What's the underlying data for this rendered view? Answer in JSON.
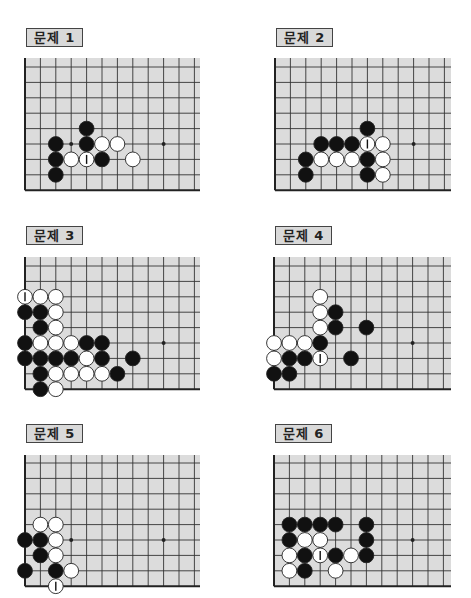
{
  "colors": {
    "board_fill": "#dcdcdc",
    "grid_line": "#333333",
    "edge_line": "#222222",
    "black_stone": "#111111",
    "white_stone": "#ffffff",
    "stone_outline": "#222222",
    "label_bg": "#d9d9d9"
  },
  "problems": [
    {
      "label": "문제 1",
      "label_pos": [
        26,
        28
      ],
      "origin": [
        25,
        67
      ],
      "top_fill": 58,
      "right_fill": 200,
      "cols": 12,
      "rows": 9,
      "hoshi": [
        [
          3,
          5
        ],
        [
          9,
          5
        ]
      ],
      "stones": [
        {
          "c": 4,
          "r": 4,
          "color": "black"
        },
        {
          "c": 2,
          "r": 5,
          "color": "black"
        },
        {
          "c": 4,
          "r": 5,
          "color": "black"
        },
        {
          "c": 5,
          "r": 5,
          "color": "white"
        },
        {
          "c": 6,
          "r": 5,
          "color": "white"
        },
        {
          "c": 2,
          "r": 6,
          "color": "black"
        },
        {
          "c": 3,
          "r": 6,
          "color": "white"
        },
        {
          "c": 4,
          "r": 6,
          "color": "white",
          "mark": true
        },
        {
          "c": 5,
          "r": 6,
          "color": "black"
        },
        {
          "c": 7,
          "r": 6,
          "color": "white"
        },
        {
          "c": 2,
          "r": 7,
          "color": "black"
        }
      ]
    },
    {
      "label": "문제 2",
      "label_pos": [
        276,
        28
      ],
      "origin": [
        275,
        67
      ],
      "top_fill": 58,
      "right_fill": 451,
      "cols": 12,
      "rows": 9,
      "hoshi": [
        [
          9,
          5
        ]
      ],
      "stones": [
        {
          "c": 6,
          "r": 4,
          "color": "black"
        },
        {
          "c": 3,
          "r": 5,
          "color": "black"
        },
        {
          "c": 4,
          "r": 5,
          "color": "black"
        },
        {
          "c": 5,
          "r": 5,
          "color": "black"
        },
        {
          "c": 6,
          "r": 5,
          "color": "white",
          "mark": true
        },
        {
          "c": 7,
          "r": 5,
          "color": "white"
        },
        {
          "c": 2,
          "r": 6,
          "color": "black"
        },
        {
          "c": 3,
          "r": 6,
          "color": "white"
        },
        {
          "c": 4,
          "r": 6,
          "color": "white"
        },
        {
          "c": 5,
          "r": 6,
          "color": "white"
        },
        {
          "c": 6,
          "r": 6,
          "color": "black"
        },
        {
          "c": 7,
          "r": 6,
          "color": "white"
        },
        {
          "c": 2,
          "r": 7,
          "color": "black"
        },
        {
          "c": 6,
          "r": 7,
          "color": "black"
        },
        {
          "c": 7,
          "r": 7,
          "color": "white"
        }
      ]
    },
    {
      "label": "문제 3",
      "label_pos": [
        26,
        226
      ],
      "origin": [
        25,
        266
      ],
      "top_fill": 257,
      "right_fill": 200,
      "cols": 12,
      "rows": 9,
      "hoshi": [
        [
          9,
          5
        ]
      ],
      "stones": [
        {
          "c": 0,
          "r": 2,
          "color": "white",
          "mark": true
        },
        {
          "c": 1,
          "r": 2,
          "color": "white"
        },
        {
          "c": 2,
          "r": 2,
          "color": "white"
        },
        {
          "c": 0,
          "r": 3,
          "color": "black"
        },
        {
          "c": 1,
          "r": 3,
          "color": "black"
        },
        {
          "c": 2,
          "r": 3,
          "color": "white"
        },
        {
          "c": 1,
          "r": 4,
          "color": "black"
        },
        {
          "c": 2,
          "r": 4,
          "color": "white"
        },
        {
          "c": 0,
          "r": 5,
          "color": "black"
        },
        {
          "c": 1,
          "r": 5,
          "color": "white"
        },
        {
          "c": 2,
          "r": 5,
          "color": "white"
        },
        {
          "c": 3,
          "r": 5,
          "color": "white"
        },
        {
          "c": 4,
          "r": 5,
          "color": "black"
        },
        {
          "c": 5,
          "r": 5,
          "color": "black"
        },
        {
          "c": 0,
          "r": 6,
          "color": "black"
        },
        {
          "c": 1,
          "r": 6,
          "color": "black"
        },
        {
          "c": 2,
          "r": 6,
          "color": "black"
        },
        {
          "c": 3,
          "r": 6,
          "color": "black"
        },
        {
          "c": 4,
          "r": 6,
          "color": "white"
        },
        {
          "c": 5,
          "r": 6,
          "color": "black"
        },
        {
          "c": 7,
          "r": 6,
          "color": "black"
        },
        {
          "c": 1,
          "r": 7,
          "color": "black"
        },
        {
          "c": 2,
          "r": 7,
          "color": "white"
        },
        {
          "c": 3,
          "r": 7,
          "color": "white"
        },
        {
          "c": 4,
          "r": 7,
          "color": "white"
        },
        {
          "c": 5,
          "r": 7,
          "color": "white"
        },
        {
          "c": 6,
          "r": 7,
          "color": "black"
        },
        {
          "c": 1,
          "r": 8,
          "color": "black"
        },
        {
          "c": 2,
          "r": 8,
          "color": "white"
        }
      ]
    },
    {
      "label": "문제 4",
      "label_pos": [
        275,
        226
      ],
      "origin": [
        274,
        266
      ],
      "top_fill": 257,
      "right_fill": 451,
      "cols": 12,
      "rows": 9,
      "hoshi": [
        [
          9,
          5
        ]
      ],
      "stones": [
        {
          "c": 3,
          "r": 2,
          "color": "white"
        },
        {
          "c": 3,
          "r": 3,
          "color": "white"
        },
        {
          "c": 4,
          "r": 3,
          "color": "black"
        },
        {
          "c": 3,
          "r": 4,
          "color": "white"
        },
        {
          "c": 4,
          "r": 4,
          "color": "black"
        },
        {
          "c": 6,
          "r": 4,
          "color": "black"
        },
        {
          "c": 0,
          "r": 5,
          "color": "white"
        },
        {
          "c": 1,
          "r": 5,
          "color": "white"
        },
        {
          "c": 2,
          "r": 5,
          "color": "white"
        },
        {
          "c": 3,
          "r": 5,
          "color": "black"
        },
        {
          "c": 0,
          "r": 6,
          "color": "white"
        },
        {
          "c": 1,
          "r": 6,
          "color": "black"
        },
        {
          "c": 2,
          "r": 6,
          "color": "black"
        },
        {
          "c": 3,
          "r": 6,
          "color": "white",
          "mark": true
        },
        {
          "c": 5,
          "r": 6,
          "color": "black"
        },
        {
          "c": 0,
          "r": 7,
          "color": "black"
        },
        {
          "c": 1,
          "r": 7,
          "color": "black"
        }
      ]
    },
    {
      "label": "문제 5",
      "label_pos": [
        26,
        424
      ],
      "origin": [
        25,
        463
      ],
      "top_fill": 455,
      "right_fill": 200,
      "cols": 12,
      "rows": 9,
      "hoshi": [
        [
          3,
          5
        ],
        [
          9,
          5
        ]
      ],
      "stones": [
        {
          "c": 1,
          "r": 4,
          "color": "white"
        },
        {
          "c": 2,
          "r": 4,
          "color": "white"
        },
        {
          "c": 0,
          "r": 5,
          "color": "black"
        },
        {
          "c": 1,
          "r": 5,
          "color": "black"
        },
        {
          "c": 2,
          "r": 5,
          "color": "white"
        },
        {
          "c": 1,
          "r": 6,
          "color": "black"
        },
        {
          "c": 2,
          "r": 6,
          "color": "white"
        },
        {
          "c": 0,
          "r": 7,
          "color": "black"
        },
        {
          "c": 2,
          "r": 7,
          "color": "black"
        },
        {
          "c": 3,
          "r": 7,
          "color": "white"
        },
        {
          "c": 2,
          "r": 8,
          "color": "white",
          "mark": true
        }
      ]
    },
    {
      "label": "문제 6",
      "label_pos": [
        275,
        424
      ],
      "origin": [
        274,
        463
      ],
      "top_fill": 455,
      "right_fill": 451,
      "cols": 12,
      "rows": 9,
      "hoshi": [
        [
          9,
          5
        ]
      ],
      "stones": [
        {
          "c": 1,
          "r": 4,
          "color": "black"
        },
        {
          "c": 2,
          "r": 4,
          "color": "black"
        },
        {
          "c": 3,
          "r": 4,
          "color": "black"
        },
        {
          "c": 4,
          "r": 4,
          "color": "black"
        },
        {
          "c": 6,
          "r": 4,
          "color": "black"
        },
        {
          "c": 1,
          "r": 5,
          "color": "black"
        },
        {
          "c": 2,
          "r": 5,
          "color": "white"
        },
        {
          "c": 3,
          "r": 5,
          "color": "white"
        },
        {
          "c": 6,
          "r": 5,
          "color": "black"
        },
        {
          "c": 1,
          "r": 6,
          "color": "white"
        },
        {
          "c": 2,
          "r": 6,
          "color": "black"
        },
        {
          "c": 3,
          "r": 6,
          "color": "white",
          "mark": true
        },
        {
          "c": 4,
          "r": 6,
          "color": "black"
        },
        {
          "c": 5,
          "r": 6,
          "color": "white"
        },
        {
          "c": 6,
          "r": 6,
          "color": "black"
        },
        {
          "c": 1,
          "r": 7,
          "color": "white"
        },
        {
          "c": 2,
          "r": 7,
          "color": "black"
        },
        {
          "c": 4,
          "r": 7,
          "color": "white"
        }
      ]
    }
  ],
  "grid": {
    "spacing": 15.4,
    "stone_radius": 7.4
  }
}
